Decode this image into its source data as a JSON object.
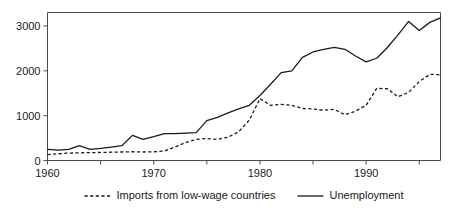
{
  "chart_data": {
    "type": "line",
    "title": "",
    "subtitle": "",
    "xlabel": "",
    "ylabel": "",
    "xlim": [
      1960,
      1997
    ],
    "ylim": [
      0,
      3300
    ],
    "grid": false,
    "legend_position": "below-axes",
    "y_ticks": [
      0,
      1000,
      2000,
      3000
    ],
    "y_tick_labels": [
      "0",
      "1000",
      "2000",
      "3000"
    ],
    "x_ticks": [
      1960,
      1965,
      1970,
      1975,
      1980,
      1985,
      1990,
      1995
    ],
    "x_tick_labels": [
      "1960",
      "",
      "1970",
      "",
      "1980",
      "",
      "1990",
      ""
    ],
    "x_major_labels": [
      "1960",
      "1970",
      "1980",
      "1990"
    ],
    "x": [
      1960,
      1961,
      1962,
      1963,
      1964,
      1965,
      1966,
      1967,
      1968,
      1969,
      1970,
      1971,
      1972,
      1973,
      1974,
      1975,
      1976,
      1977,
      1978,
      1979,
      1980,
      1981,
      1982,
      1983,
      1984,
      1985,
      1986,
      1987,
      1988,
      1989,
      1990,
      1991,
      1992,
      1993,
      1994,
      1995,
      1996,
      1997
    ],
    "series": [
      {
        "name": "Imports from low-wage countries",
        "style": "dashed",
        "color": "#1a1a1a",
        "values": [
          130,
          150,
          165,
          170,
          175,
          180,
          185,
          190,
          195,
          190,
          195,
          210,
          300,
          400,
          470,
          490,
          470,
          520,
          640,
          900,
          1380,
          1230,
          1250,
          1230,
          1160,
          1150,
          1120,
          1140,
          1020,
          1100,
          1230,
          1610,
          1600,
          1420,
          1520,
          1760,
          1920,
          1915
        ]
      },
      {
        "name": "Unemployment",
        "style": "solid",
        "color": "#1a1a1a",
        "values": [
          250,
          230,
          250,
          330,
          250,
          270,
          300,
          330,
          560,
          470,
          530,
          600,
          600,
          610,
          620,
          890,
          960,
          1060,
          1150,
          1230,
          1450,
          1700,
          1960,
          2000,
          2300,
          2420,
          2480,
          2520,
          2480,
          2330,
          2200,
          2280,
          2520,
          2800,
          3100,
          2900,
          3080,
          3180
        ]
      }
    ],
    "legend": [
      {
        "label": "Imports from low-wage countries",
        "style": "dashed"
      },
      {
        "label": "Unemployment",
        "style": "solid"
      }
    ]
  }
}
